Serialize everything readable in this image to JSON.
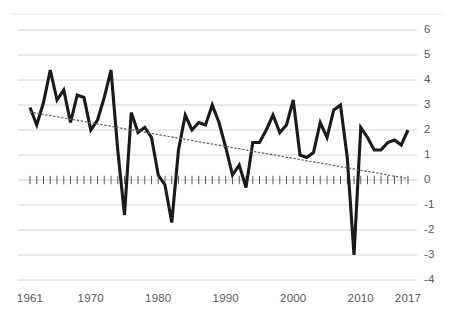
{
  "chart_data": {
    "type": "line",
    "title": "",
    "xlabel": "",
    "ylabel": "",
    "xlim": [
      1961,
      2017
    ],
    "ylim": [
      -4,
      6
    ],
    "grid": true,
    "legend": "none",
    "x_tick_labels": [
      "1961",
      "1970",
      "1980",
      "1990",
      "2000",
      "2010",
      "2017"
    ],
    "x_tick_values": [
      1961,
      1970,
      1980,
      1990,
      2000,
      2010,
      2017
    ],
    "y_tick_labels": [
      "6",
      "5",
      "4",
      "3",
      "2",
      "1",
      "0",
      "-1",
      "-2",
      "-3",
      "-4"
    ],
    "y_tick_values": [
      6,
      5,
      4,
      3,
      2,
      1,
      0,
      -1,
      -2,
      -3,
      -4
    ],
    "zero_line": 0,
    "zero_line_has_year_ticks": true,
    "x": [
      1961,
      1962,
      1963,
      1964,
      1965,
      1966,
      1967,
      1968,
      1969,
      1970,
      1971,
      1972,
      1973,
      1974,
      1975,
      1976,
      1977,
      1978,
      1979,
      1980,
      1981,
      1982,
      1983,
      1984,
      1985,
      1986,
      1987,
      1988,
      1989,
      1990,
      1991,
      1992,
      1993,
      1994,
      1995,
      1996,
      1997,
      1998,
      1999,
      2000,
      2001,
      2002,
      2003,
      2004,
      2005,
      2006,
      2007,
      2008,
      2009,
      2010,
      2011,
      2012,
      2013,
      2014,
      2015,
      2016,
      2017
    ],
    "series": [
      {
        "name": "annual-series",
        "style": "solid",
        "color": "#1a1a1a",
        "width": 3.1,
        "values": [
          2.9,
          2.2,
          3.1,
          4.4,
          3.2,
          3.6,
          2.3,
          3.4,
          3.3,
          2.0,
          2.4,
          3.3,
          4.4,
          1.2,
          -1.4,
          2.7,
          1.9,
          2.1,
          1.7,
          0.2,
          -0.2,
          -1.7,
          1.2,
          2.6,
          2.0,
          2.3,
          2.2,
          3.0,
          2.3,
          1.3,
          0.2,
          0.6,
          -0.3,
          1.5,
          1.5,
          2.0,
          2.6,
          1.9,
          2.2,
          3.2,
          1.0,
          0.9,
          1.1,
          2.3,
          1.7,
          2.8,
          3.0,
          0.9,
          -3.0,
          2.1,
          1.7,
          1.2,
          1.2,
          1.5,
          1.6,
          1.4,
          2.0
        ]
      },
      {
        "name": "trend-line",
        "style": "dotted",
        "color": "#6a6a6e",
        "width": 1.3,
        "values": [
          2.72,
          2.67,
          2.62,
          2.58,
          2.53,
          2.48,
          2.43,
          2.39,
          2.34,
          2.29,
          2.24,
          2.2,
          2.15,
          2.1,
          2.05,
          2.01,
          1.96,
          1.91,
          1.86,
          1.82,
          1.77,
          1.72,
          1.67,
          1.63,
          1.58,
          1.53,
          1.48,
          1.44,
          1.39,
          1.34,
          1.29,
          1.25,
          1.2,
          1.15,
          1.1,
          1.06,
          1.01,
          0.96,
          0.91,
          0.87,
          0.82,
          0.77,
          0.72,
          0.68,
          0.63,
          0.58,
          0.53,
          0.49,
          0.44,
          0.39,
          0.34,
          0.3,
          0.25,
          0.2,
          0.15,
          0.11,
          0.06
        ]
      }
    ]
  },
  "axis": {
    "y_label_color": "#58585a",
    "x_label_color": "#58585a",
    "gridline_color": "#c9c9cd"
  }
}
